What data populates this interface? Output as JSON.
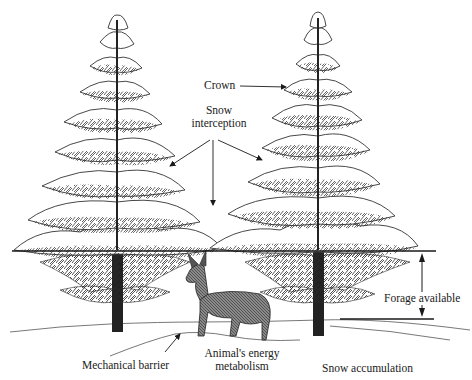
{
  "diagram": {
    "colors": {
      "ink": "#1a1a1a",
      "background": "#ffffff",
      "snow": "#ffffff",
      "foliage": "#2b2b2b",
      "trunk": "#222222"
    },
    "labels": {
      "crown": "Crown",
      "snow_interception_line1": "Snow",
      "snow_interception_line2": "interception",
      "forage_available": "Forage available",
      "mechanical_barrier": "Mechanical barrier",
      "energy_line1": "Animal's energy",
      "energy_line2": "metabolism",
      "snow_accumulation": "Snow accumulation"
    },
    "elements": [
      {
        "id": "tree-left",
        "type": "snow-covered conifer"
      },
      {
        "id": "tree-right",
        "type": "snow-covered conifer"
      },
      {
        "id": "deer",
        "type": "animal"
      },
      {
        "id": "snow-line",
        "type": "horizontal reference line"
      },
      {
        "id": "forage-dimension",
        "type": "double arrow"
      }
    ]
  }
}
